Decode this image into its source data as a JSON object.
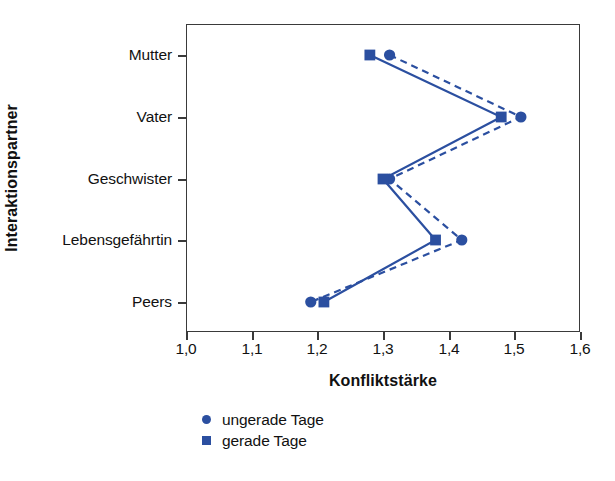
{
  "chart_data": {
    "type": "line",
    "title": "",
    "xlabel": "Konfliktstärke",
    "ylabel": "Interaktionspartner",
    "orientation": "horizontal",
    "categories": [
      "Mutter",
      "Vater",
      "Geschwister",
      "Lebensgefährtin",
      "Peers"
    ],
    "xlim": [
      1.0,
      1.6
    ],
    "xticks": [
      1.0,
      1.1,
      1.2,
      1.3,
      1.4,
      1.5,
      1.6
    ],
    "xticklabels": [
      "1,0",
      "1,1",
      "1,2",
      "1,3",
      "1,4",
      "1,5",
      "1,6"
    ],
    "grid": false,
    "legend_position": "below-left",
    "series": [
      {
        "name": "ungerade Tage",
        "marker": "circle",
        "linestyle": "dashed",
        "color": "#2b4fa0",
        "values": [
          1.31,
          1.51,
          1.31,
          1.42,
          1.19
        ]
      },
      {
        "name": "gerade Tage",
        "marker": "square",
        "linestyle": "solid",
        "color": "#2b4fa0",
        "values": [
          1.28,
          1.48,
          1.3,
          1.38,
          1.21
        ]
      }
    ]
  },
  "axes": {
    "y_title": "Interaktionspartner",
    "x_title": "Konfliktstärke",
    "category_labels": [
      "Mutter",
      "Vater",
      "Geschwister",
      "Lebensgefährtin",
      "Peers"
    ],
    "x_tick_labels": [
      "1,0",
      "1,1",
      "1,2",
      "1,3",
      "1,4",
      "1,5",
      "1,6"
    ]
  },
  "legend": {
    "items": [
      {
        "label": "ungerade Tage",
        "marker": "circle-marker",
        "color": "#2b4fa0"
      },
      {
        "label": "gerade Tage",
        "marker": "square-marker",
        "color": "#2b4fa0"
      }
    ]
  },
  "colors": {
    "series": "#2b4fa0",
    "axis": "#3a3a3a",
    "text": "#111111",
    "background": "#ffffff"
  }
}
